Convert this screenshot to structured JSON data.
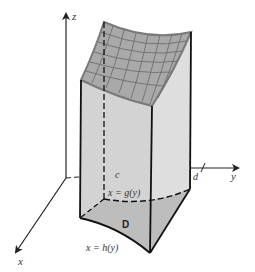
{
  "diagram": {
    "type": "3d-solid-region",
    "axes": {
      "z_label": "z",
      "x_label": "x",
      "y_label": "y"
    },
    "ticks": {
      "c_label": "c",
      "d_label": "d"
    },
    "curves": {
      "back_curve_label": "x = g(y)",
      "front_curve_label": "x = h(y)"
    },
    "region_label": "D",
    "colors": {
      "surface_fill": "#a9a9a9",
      "surface_grid": "#6e6e6e",
      "side_fill": "#d9d9d9",
      "front_side_fill": "#cfcfcf",
      "region_fill": "#b8b8b8",
      "edge": "#111111",
      "axis": "#222222"
    }
  }
}
